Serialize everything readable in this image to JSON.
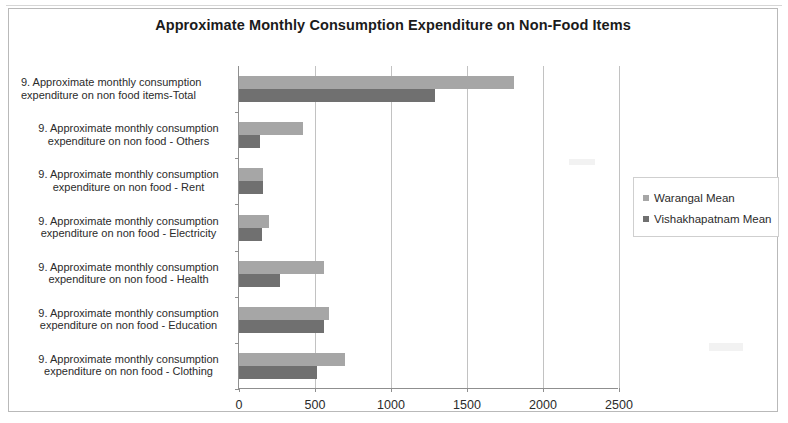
{
  "chart_data": {
    "type": "bar",
    "orientation": "horizontal",
    "title": "Approximate Monthly Consumption Expenditure on Non-Food Items",
    "xlabel": "",
    "ylabel": "",
    "xlim": [
      0,
      2500
    ],
    "xticks": [
      0,
      500,
      1000,
      1500,
      2000,
      2500
    ],
    "xtick_labels": [
      "0",
      "500",
      "1000",
      "1500",
      "2000",
      "2500"
    ],
    "grid": true,
    "legend_position": "right",
    "categories": [
      "9. Approximate monthly consumption expenditure on non food items-Total",
      "9. Approximate monthly consumption expenditure on non food - Others",
      "9. Approximate monthly consumption expenditure on non food - Rent",
      "9. Approximate monthly consumption expenditure on non food - Electricity",
      "9. Approximate monthly consumption expenditure on non food - Health",
      "9. Approximate monthly consumption expenditure on non food - Education",
      "9. Approximate monthly consumption expenditure on non food - Clothing"
    ],
    "category_lines": [
      [
        "9. Approximate monthly consumption",
        "expenditure on non food items-Total"
      ],
      [
        "9. Approximate monthly consumption",
        "expenditure on non food - Others"
      ],
      [
        "9. Approximate monthly consumption",
        "expenditure on non food - Rent"
      ],
      [
        "9. Approximate monthly consumption",
        "expenditure on non food - Electricity"
      ],
      [
        "9. Approximate monthly consumption",
        "expenditure on non food - Health"
      ],
      [
        "9. Approximate monthly consumption",
        "expenditure on non food - Education"
      ],
      [
        "9. Approximate monthly consumption",
        "expenditure on non food - Clothing"
      ]
    ],
    "series": [
      {
        "name": "Warangal Mean",
        "color": "#a6a6a6",
        "values": [
          1810,
          420,
          155,
          200,
          560,
          590,
          700
        ]
      },
      {
        "name": "Vishakhapatnam Mean",
        "color": "#707070",
        "values": [
          1290,
          135,
          155,
          150,
          270,
          560,
          510
        ]
      }
    ]
  },
  "legend": {
    "items": [
      {
        "label": "Warangal Mean",
        "color": "#a6a6a6"
      },
      {
        "label": "Vishakhapatnam Mean",
        "color": "#707070"
      }
    ]
  }
}
